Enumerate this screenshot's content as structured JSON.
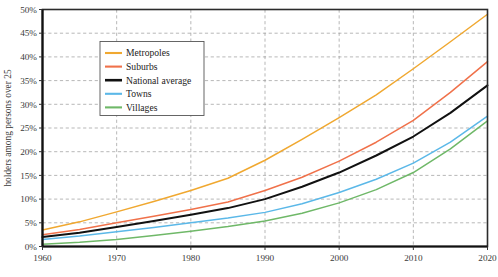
{
  "chart_data": {
    "type": "line",
    "title": "",
    "xlabel": "",
    "ylabel": "holders among persons over 25",
    "xlim": [
      1960,
      2020
    ],
    "ylim": [
      0,
      50
    ],
    "grid": true,
    "legend_position": "top-left-inside",
    "x": [
      1960,
      1965,
      1970,
      1975,
      1980,
      1985,
      1990,
      1995,
      2000,
      2005,
      2010,
      2015,
      2020
    ],
    "xticks": [
      "1960",
      "1970",
      "1980",
      "1990",
      "2000",
      "2010",
      "2020"
    ],
    "xtick_values": [
      1960,
      1970,
      1980,
      1990,
      2000,
      2010,
      2020
    ],
    "yticks": [
      "0%",
      "5%",
      "10%",
      "15%",
      "20%",
      "25%",
      "30%",
      "35%",
      "40%",
      "45%",
      "50%"
    ],
    "ytick_values": [
      0,
      5,
      10,
      15,
      20,
      25,
      30,
      35,
      40,
      45,
      50
    ],
    "series": [
      {
        "name": "Metropoles",
        "color": "#F0A830",
        "values": [
          3.5,
          5.2,
          7.3,
          9.5,
          11.8,
          14.4,
          18.2,
          22.6,
          27.2,
          32.0,
          37.5,
          43.2,
          49.0
        ]
      },
      {
        "name": "Suburbs",
        "color": "#F0714A",
        "values": [
          2.5,
          3.6,
          5.0,
          6.4,
          7.8,
          9.4,
          11.8,
          14.6,
          18.0,
          22.0,
          26.6,
          32.5,
          39.0
        ]
      },
      {
        "name": "National average",
        "color": "#111111",
        "values": [
          2.0,
          2.9,
          4.1,
          5.4,
          6.7,
          8.1,
          10.0,
          12.6,
          15.6,
          19.2,
          23.2,
          28.2,
          34.0
        ]
      },
      {
        "name": "Towns",
        "color": "#5BB8E8",
        "values": [
          1.5,
          2.2,
          3.1,
          4.0,
          5.0,
          6.0,
          7.2,
          9.0,
          11.4,
          14.2,
          17.6,
          22.0,
          27.5
        ]
      },
      {
        "name": "Villages",
        "color": "#6FB868",
        "values": [
          0.5,
          0.9,
          1.5,
          2.3,
          3.2,
          4.2,
          5.4,
          7.0,
          9.2,
          12.0,
          15.6,
          20.6,
          26.5
        ]
      }
    ]
  },
  "legend": {
    "items": [
      {
        "label": "Metropoles"
      },
      {
        "label": "Suburbs"
      },
      {
        "label": "National average"
      },
      {
        "label": "Towns"
      },
      {
        "label": "Villages"
      }
    ]
  },
  "caption": {
    "text": ""
  }
}
